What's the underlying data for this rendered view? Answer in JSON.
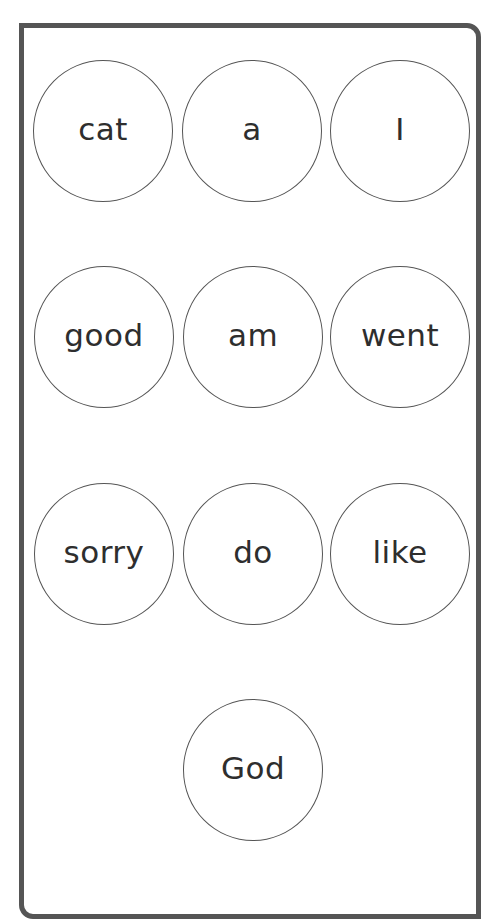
{
  "card": {
    "border_color": "#555555",
    "words": [
      {
        "label": "cat"
      },
      {
        "label": "a"
      },
      {
        "label": "I"
      },
      {
        "label": "good"
      },
      {
        "label": "am"
      },
      {
        "label": "went"
      },
      {
        "label": "sorry"
      },
      {
        "label": "do"
      },
      {
        "label": "like"
      },
      {
        "label": "God"
      }
    ]
  }
}
